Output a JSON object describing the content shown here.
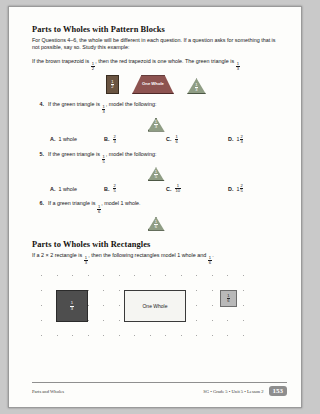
{
  "page": {
    "section1": {
      "title": "Parts to Wholes with Pattern Blocks",
      "intro": "For Questions 4–6, the whole will be different in each question. If a question asks for something that is not possible, say so. Study this example:",
      "example": {
        "part1": "If the brown trapezoid is",
        "frac1": {
          "num": "1",
          "den": "2"
        },
        "part2": ", then the red trapezoid is one whole. The green triangle is",
        "frac2": {
          "num": "1",
          "den": "3"
        }
      },
      "example_blocks": [
        {
          "shape": "brown-rhombus",
          "label_num": "1",
          "label_den": "2"
        },
        {
          "shape": "red-trapezoid",
          "label": "One Whole"
        },
        {
          "shape": "green-triangle",
          "label_num": "1",
          "label_den": "3"
        }
      ]
    },
    "questions": [
      {
        "number": "4.",
        "text_before": "If the green triangle is",
        "frac": {
          "num": "1",
          "den": "3"
        },
        "text_after": ", model the following:",
        "shape": {
          "shape": "green-triangle",
          "label_num": "1",
          "label_den": "3"
        },
        "choices": [
          {
            "label": "A.",
            "value": "1 whole"
          },
          {
            "label": "B.",
            "frac": {
              "num": "2",
              "den": "3"
            }
          },
          {
            "label": "C.",
            "frac": {
              "num": "1",
              "den": "6"
            }
          },
          {
            "label": "D.",
            "whole": "1",
            "frac": {
              "num": "2",
              "den": "3"
            }
          }
        ]
      },
      {
        "number": "5.",
        "text_before": "If the green triangle is",
        "frac": {
          "num": "1",
          "den": "5"
        },
        "text_after": ", model the following:",
        "shape": {
          "shape": "green-triangle",
          "label_num": "1",
          "label_den": "5"
        },
        "choices": [
          {
            "label": "A.",
            "value": "1 whole"
          },
          {
            "label": "B.",
            "frac": {
              "num": "2",
              "den": "5"
            }
          },
          {
            "label": "C.",
            "frac": {
              "num": "1",
              "den": "10"
            }
          },
          {
            "label": "D.",
            "whole": "1",
            "frac": {
              "num": "2",
              "den": "5"
            }
          }
        ]
      },
      {
        "number": "6.",
        "text_before": "If a green triangle is",
        "frac": {
          "num": "1",
          "den": "6"
        },
        "text_after": ", model 1 whole.",
        "shape": {
          "shape": "green-triangle",
          "label_num": "1",
          "label_den": "6"
        }
      }
    ],
    "section2": {
      "title": "Parts to Wholes with Rectangles",
      "intro_part1": "If a 2 × 2 rectangle is",
      "frac1": {
        "num": "1",
        "den": "3"
      },
      "intro_part2": ", then the following rectangles model 1 whole and",
      "frac2": {
        "num": "1",
        "den": "6"
      },
      "intro_part3": ".",
      "rectangles": [
        {
          "name": "dark-square",
          "frac": {
            "num": "1",
            "den": "3"
          }
        },
        {
          "name": "one-whole-rectangle",
          "label": "One Whole"
        },
        {
          "name": "small-gray-rectangle",
          "frac": {
            "num": "1",
            "den": "6"
          }
        }
      ]
    },
    "footer": {
      "left": "Parts and Wholes",
      "meta": "SG • Grade 5 • Unit 5 • Lesson 2",
      "page_number": "153"
    }
  }
}
